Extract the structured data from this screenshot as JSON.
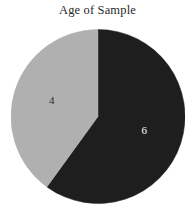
{
  "chart_data": {
    "type": "pie",
    "title": "Age of Sample",
    "xlabel": "",
    "ylabel": "",
    "categories": [
      "6",
      "4"
    ],
    "values": [
      6,
      4
    ],
    "labels": [
      "6",
      "4"
    ],
    "total": 10,
    "legend": "none",
    "grid": false,
    "series": [
      {
        "name": "Age of Sample",
        "values": [
          6,
          4
        ]
      }
    ],
    "slices": [
      {
        "label": "6",
        "value": 6,
        "percent": "60%",
        "start_angle_deg": 0,
        "end_angle_deg": 216,
        "color": "#1e1e1e",
        "label_color": "#ffffff"
      },
      {
        "label": "4",
        "value": 4,
        "percent": "40%",
        "start_angle_deg": 216,
        "end_angle_deg": 360,
        "color": "#b0b0b0",
        "label_color": "#2b2b2b"
      }
    ],
    "colors": {
      "slice_dark": "#1e1e1e",
      "slice_light": "#b0b0b0",
      "background": "#ffffff",
      "title_text": "#2a2a2a"
    }
  },
  "figure": {
    "title": "Age of Sample",
    "background": "#ffffff"
  }
}
